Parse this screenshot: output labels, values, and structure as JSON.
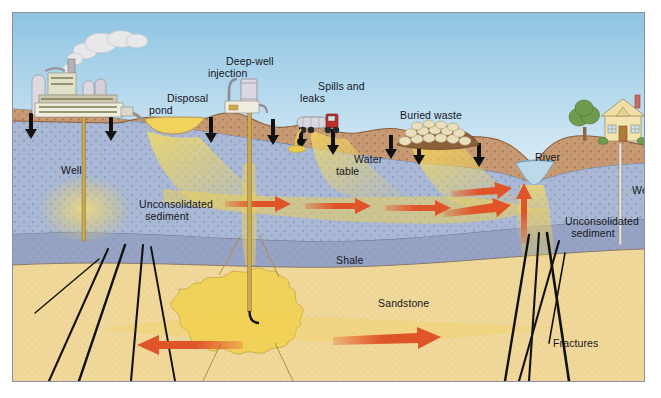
{
  "figure": {
    "type": "diagram",
    "background_color": "#ffffff",
    "frame": {
      "border_color": "#8d8f9e",
      "x": 12,
      "y": 12,
      "width": 633,
      "height": 370
    }
  },
  "palette": {
    "sky_top": "#8ec4e2",
    "sky_bottom": "#d8ecf6",
    "soil": "#c89a73",
    "soil_dark": "#a8794f",
    "aquifer": "#a9b8d4",
    "aquifer_saturated": "#9fb2d0",
    "shale": "#97a3c4",
    "sandstone": "#f0d79a",
    "contaminant_plume": "#f2d24e",
    "arrow_orange": "#e0542a",
    "fracture_black": "#111111",
    "well_casing": "#c9a94f",
    "river_water": "#bcd9ea",
    "smoke": "#e8e8ea",
    "house_wall": "#f2e3b0",
    "tree_green": "#6f9b4e",
    "truck_cab": "#b8312c",
    "waste_drum": "#eadfbc"
  },
  "labels": [
    {
      "id": "disposal-pond",
      "text": "Disposal\npond",
      "x": 148,
      "y": 78,
      "align": "left"
    },
    {
      "id": "deep-well-injection",
      "text": "Deep-well\ninjection",
      "x": 207,
      "y": 41,
      "align": "left"
    },
    {
      "id": "spills-and-leaks",
      "text": "Spills and\nleaks",
      "x": 299,
      "y": 66,
      "align": "left"
    },
    {
      "id": "buried-waste",
      "text": "Buried waste",
      "x": 381,
      "y": 95,
      "align": "left"
    },
    {
      "id": "river",
      "text": "River",
      "x": 516,
      "y": 137,
      "align": "left"
    },
    {
      "id": "well-left",
      "text": "Well",
      "x": 42,
      "y": 150,
      "align": "left"
    },
    {
      "id": "well-right",
      "text": "Well",
      "x": 613,
      "y": 170,
      "align": "left"
    },
    {
      "id": "water-table",
      "text": "Water\ntable",
      "x": 335,
      "y": 139,
      "align": "left"
    },
    {
      "id": "unconsolidated-sediment-left",
      "text": "Unconsolidated\nsediment",
      "x": 120,
      "y": 184,
      "align": "left"
    },
    {
      "id": "unconsolidated-sediment-right",
      "text": "Unconsolidated\nsediment",
      "x": 546,
      "y": 201,
      "align": "left"
    },
    {
      "id": "shale",
      "text": "Shale",
      "x": 317,
      "y": 240,
      "align": "left"
    },
    {
      "id": "sandstone",
      "text": "Sandstone",
      "x": 359,
      "y": 283,
      "align": "left"
    },
    {
      "id": "fractures",
      "text": "Fractures",
      "x": 534,
      "y": 323,
      "align": "left"
    }
  ],
  "contamination_sources": [
    {
      "id": "factory",
      "name": "industrial facility with smokestack",
      "x": 20,
      "y": 30
    },
    {
      "id": "disposal-pond",
      "name": "surface disposal pond",
      "x": 128,
      "y": 108
    },
    {
      "id": "deep-well-injection",
      "name": "deep-well injection facility",
      "x": 212,
      "y": 78
    },
    {
      "id": "tanker-truck",
      "name": "leaking tanker truck",
      "x": 285,
      "y": 105
    },
    {
      "id": "buried-waste",
      "name": "buried waste drums",
      "x": 395,
      "y": 116
    },
    {
      "id": "house",
      "name": "residence with private well",
      "x": 595,
      "y": 108
    }
  ],
  "geologic_layers": [
    {
      "id": "soil",
      "label": "",
      "color": "#c89a73"
    },
    {
      "id": "aquifer",
      "label": "Unconsolidated sediment",
      "color": "#a9b8d4"
    },
    {
      "id": "shale",
      "label": "Shale",
      "color": "#97a3c4"
    },
    {
      "id": "sandstone",
      "label": "Sandstone",
      "color": "#f0d79a"
    }
  ],
  "flow_arrows": [
    {
      "id": "aquifer-flow-1",
      "direction": "right",
      "layer": "aquifer"
    },
    {
      "id": "aquifer-flow-2",
      "direction": "right",
      "layer": "aquifer"
    },
    {
      "id": "aquifer-flow-3",
      "direction": "right",
      "layer": "aquifer"
    },
    {
      "id": "aquifer-flow-4",
      "direction": "right",
      "layer": "aquifer"
    },
    {
      "id": "river-discharge-up",
      "direction": "up",
      "layer": "aquifer"
    },
    {
      "id": "sandstone-flow-left",
      "direction": "left",
      "layer": "sandstone"
    },
    {
      "id": "sandstone-flow-right",
      "direction": "right",
      "layer": "sandstone"
    }
  ],
  "infiltration_arrows_count": 9,
  "wells": [
    {
      "id": "well-left",
      "label": "Well",
      "x": 70
    },
    {
      "id": "injection-well",
      "label": "",
      "x": 236
    },
    {
      "id": "well-right",
      "label": "Well",
      "x": 607
    }
  ]
}
